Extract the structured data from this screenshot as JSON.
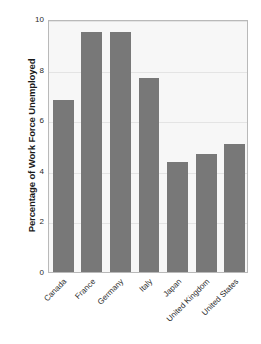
{
  "chart_data": {
    "type": "bar",
    "title": "",
    "xlabel": "",
    "ylabel": "Percentage of Work Force Unemployed",
    "categories": [
      "Canada",
      "France",
      "Germany",
      "Italy",
      "Japan",
      "United Kingdom",
      "United States"
    ],
    "values": [
      6.8,
      9.5,
      9.5,
      7.65,
      4.35,
      4.65,
      5.05
    ],
    "ylim": [
      0,
      10
    ],
    "yticks": [
      0,
      2,
      4,
      6,
      8,
      10
    ],
    "ytick_labels": [
      "0",
      "2",
      "4",
      "6",
      "8",
      "10"
    ],
    "grid": true,
    "legend": false,
    "bar_color": "#787878",
    "plot_background": "#f7f7f7",
    "frame_color": "#b9b9b9",
    "gridline_color": "#e4e4e4",
    "text_color": "#2b2b2b"
  }
}
